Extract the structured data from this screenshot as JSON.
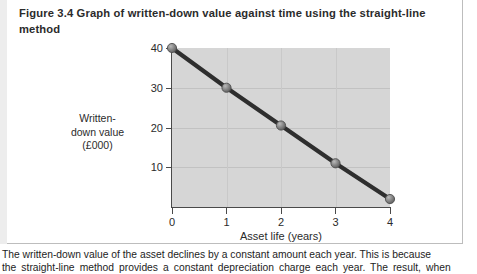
{
  "figure": {
    "title": "Figure 3.4  Graph of written-down value against time using the straight-line method",
    "caption_line_1": "The written-down value of the asset declines by a constant amount each year. This is because",
    "caption_line_2": "the straight-line method provides a constant depreciation charge each year. The result, when"
  },
  "chart_data": {
    "type": "line",
    "title": "Graph of written-down value against time using the straight-line method",
    "xlabel": "Asset life (years)",
    "ylabel": "Written-down value (£000)",
    "ylabel_lines": [
      "Written-",
      "down value",
      "(£000)"
    ],
    "x": [
      0,
      1,
      2,
      3,
      4
    ],
    "values": [
      40,
      30,
      20.5,
      11,
      2
    ],
    "xticks": [
      "0",
      "1",
      "2",
      "3",
      "4"
    ],
    "yticks": [
      "10",
      "20",
      "30",
      "40"
    ],
    "xlim": [
      0,
      4
    ],
    "ylim": [
      0,
      40
    ],
    "grid": true,
    "legend": "none",
    "series": [
      {
        "name": "Written-down value",
        "values": [
          40,
          30,
          20.5,
          11,
          2
        ]
      }
    ],
    "colors": {
      "plot_background": "#d6d6d6",
      "line": "#2e2e2e",
      "marker": "#7a7a7a",
      "axis": "#4a4a4a",
      "grid": "#c2c2c2"
    }
  }
}
